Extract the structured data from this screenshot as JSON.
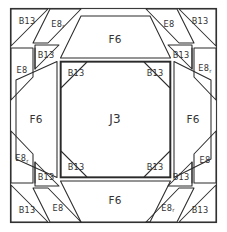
{
  "diagram": {
    "center": {
      "label": "J3",
      "name": "center-octagon"
    },
    "trapezoids": [
      {
        "id": "top",
        "label": "F6"
      },
      {
        "id": "left",
        "label": "F6"
      },
      {
        "id": "right",
        "label": "F6"
      },
      {
        "id": "bottom",
        "label": "F6"
      }
    ],
    "inner_corner_triangles": [
      {
        "id": "inner-top-left",
        "label": "B13"
      },
      {
        "id": "inner-top-right",
        "label": "B13"
      },
      {
        "id": "inner-bottom-left",
        "label": "B13"
      },
      {
        "id": "inner-bottom-right",
        "label": "B13"
      }
    ],
    "corners": {
      "top_left": [
        {
          "id": "tl-outer-triangle",
          "label": "B13"
        },
        {
          "id": "tl-parallelogram-h",
          "label": "E8",
          "suffix": "r"
        },
        {
          "id": "tl-inner-triangle",
          "label": "B13"
        },
        {
          "id": "tl-parallelogram-v",
          "label": "E8",
          "suffix": ""
        }
      ],
      "top_right": [
        {
          "id": "tr-parallelogram-h",
          "label": "E8",
          "suffix": ""
        },
        {
          "id": "tr-outer-triangle",
          "label": "B13"
        },
        {
          "id": "tr-inner-triangle",
          "label": "B13"
        },
        {
          "id": "tr-parallelogram-v",
          "label": "E8",
          "suffix": "r"
        }
      ],
      "bottom_left": [
        {
          "id": "bl-parallelogram-v",
          "label": "E8",
          "suffix": "r"
        },
        {
          "id": "bl-inner-triangle",
          "label": "B13"
        },
        {
          "id": "bl-outer-triangle",
          "label": "B13"
        },
        {
          "id": "bl-parallelogram-h",
          "label": "E8",
          "suffix": ""
        }
      ],
      "bottom_right": [
        {
          "id": "br-parallelogram-v",
          "label": "E8",
          "suffix": ""
        },
        {
          "id": "br-inner-triangle",
          "label": "B13"
        },
        {
          "id": "br-parallelogram-h",
          "label": "E8",
          "suffix": "r"
        },
        {
          "id": "br-outer-triangle",
          "label": "B13"
        }
      ]
    },
    "colors": {
      "ink": "#2b2b2b",
      "paper": "#ffffff"
    }
  }
}
